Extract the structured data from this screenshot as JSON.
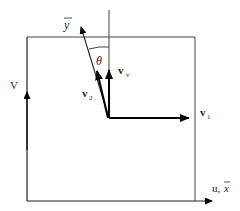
{
  "diagram": {
    "labels": {
      "y_bar": "y",
      "theta": "θ",
      "v_v_main": "v",
      "v_v_sub": "v",
      "v2_main": "v",
      "v2_sub": "2",
      "v1_main": "v",
      "v1_sub": "1",
      "V_axis": "V",
      "u_axis": "u,",
      "x_bar": "x"
    },
    "colors": {
      "line": "#333333",
      "arrow": "#000000",
      "background": "#ffffff"
    }
  }
}
